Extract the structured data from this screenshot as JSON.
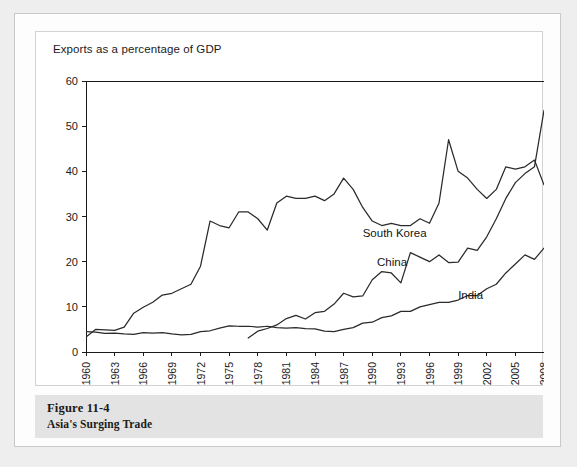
{
  "figure": {
    "caption_number": "Figure 11-4",
    "caption_title": "Asia's Surging Trade"
  },
  "chart_data": {
    "type": "line",
    "title": "Exports as a percentage of GDP",
    "xlabel": "",
    "ylabel": "",
    "ylim": [
      0,
      60
    ],
    "ytick_values": [
      0,
      10,
      20,
      30,
      40,
      50,
      60
    ],
    "ytick_labels": [
      "0",
      "10",
      "20",
      "30",
      "40",
      "50",
      "60"
    ],
    "xlim": [
      1960,
      2008
    ],
    "xtick_values": [
      1960,
      1963,
      1966,
      1969,
      1972,
      1975,
      1978,
      1981,
      1984,
      1987,
      1990,
      1993,
      1996,
      1999,
      2002,
      2005,
      2008
    ],
    "xtick_labels": [
      "1960",
      "1963",
      "1966",
      "1969",
      "1972",
      "1975",
      "1978",
      "1981",
      "1984",
      "1987",
      "1990",
      "1993",
      "1996",
      "1999",
      "2002",
      "2005",
      "2008"
    ],
    "grid": false,
    "legend": "inline-annotations",
    "line_color": "#2a2a2a",
    "series": [
      {
        "name": "South Korea",
        "label_x": 1989.0,
        "label_y": 25.5,
        "x": [
          1960,
          1961,
          1962,
          1963,
          1964,
          1965,
          1966,
          1967,
          1968,
          1969,
          1970,
          1971,
          1972,
          1973,
          1974,
          1975,
          1976,
          1977,
          1978,
          1979,
          1980,
          1981,
          1982,
          1983,
          1984,
          1985,
          1986,
          1987,
          1988,
          1989,
          1990,
          1991,
          1992,
          1993,
          1994,
          1995,
          1996,
          1997,
          1998,
          1999,
          2000,
          2001,
          2002,
          2003,
          2004,
          2005,
          2006,
          2007,
          2008
        ],
        "values": [
          3.3,
          5.0,
          4.9,
          4.8,
          5.5,
          8.6,
          9.9,
          11.0,
          12.6,
          13.0,
          14.0,
          15.0,
          19.0,
          29.0,
          28.0,
          27.5,
          31.0,
          31.0,
          29.5,
          27.0,
          33.0,
          34.5,
          34.0,
          34.0,
          34.5,
          33.5,
          35.0,
          38.5,
          36.0,
          32.0,
          29.0,
          28.0,
          28.5,
          28.0,
          28.0,
          29.5,
          28.5,
          33.0,
          47.0,
          40.0,
          38.5,
          36.0,
          34.0,
          36.0,
          41.0,
          40.5,
          41.0,
          42.5,
          37.0
        ]
      },
      {
        "name": "China",
        "label_x": 1990.5,
        "label_y": 19.0,
        "x": [
          1977,
          1978,
          1979,
          1980,
          1981,
          1982,
          1983,
          1984,
          1985,
          1986,
          1987,
          1988,
          1989,
          1990,
          1991,
          1992,
          1993,
          1994,
          1995,
          1996,
          1997,
          1998,
          1999,
          2000,
          2001,
          2002,
          2003,
          2004,
          2005,
          2006,
          2007,
          2008
        ],
        "values": [
          3.1,
          4.6,
          5.2,
          6.0,
          7.4,
          8.1,
          7.3,
          8.7,
          9.0,
          10.6,
          13.0,
          12.2,
          12.4,
          16.0,
          17.8,
          17.5,
          15.3,
          22.0,
          21.0,
          20.0,
          21.5,
          19.8,
          19.9,
          23.0,
          22.5,
          25.5,
          29.5,
          34.0,
          37.5,
          39.5,
          41.0,
          53.5
        ]
      },
      {
        "name": "India",
        "label_x": 1999.0,
        "label_y": 11.8,
        "x": [
          1960,
          1961,
          1962,
          1963,
          1964,
          1965,
          1966,
          1967,
          1968,
          1969,
          1970,
          1971,
          1972,
          1973,
          1974,
          1975,
          1976,
          1977,
          1978,
          1979,
          1980,
          1981,
          1982,
          1983,
          1984,
          1985,
          1986,
          1987,
          1988,
          1989,
          1990,
          1991,
          1992,
          1993,
          1994,
          1995,
          1996,
          1997,
          1998,
          1999,
          2000,
          2001,
          2002,
          2003,
          2004,
          2005,
          2006,
          2007,
          2008
        ],
        "values": [
          4.5,
          4.4,
          4.1,
          4.2,
          4.0,
          3.9,
          4.3,
          4.2,
          4.3,
          4.0,
          3.8,
          3.9,
          4.5,
          4.7,
          5.3,
          5.8,
          5.7,
          5.7,
          5.5,
          5.7,
          5.4,
          5.3,
          5.4,
          5.2,
          5.1,
          4.6,
          4.5,
          5.0,
          5.4,
          6.4,
          6.6,
          7.6,
          8.0,
          9.0,
          9.0,
          10.0,
          10.5,
          11.0,
          11.0,
          11.5,
          12.5,
          12.5,
          14.0,
          15.0,
          17.5,
          19.5,
          21.5,
          20.5,
          23.0
        ]
      }
    ]
  }
}
